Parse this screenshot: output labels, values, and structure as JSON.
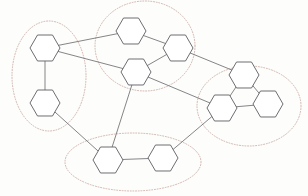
{
  "diagram": {
    "canvas": {
      "width": 308,
      "height": 196,
      "background": "#fdfdfc"
    },
    "style": {
      "node_fill": "#ffffff",
      "node_stroke": "#5d5d63",
      "edge_color": "#6f6f73",
      "cluster_stroke": "#c9a9a0",
      "cluster_dash": "dotted"
    },
    "clusters": [
      {
        "id": "cluster-left",
        "label": "",
        "cx": 49,
        "cy": 76,
        "rx": 37,
        "ry": 55,
        "rotate": 0,
        "members": [
          "n1",
          "n2"
        ]
      },
      {
        "id": "cluster-top-middle",
        "label": "",
        "cx": 145,
        "cy": 46,
        "rx": 50,
        "ry": 45,
        "rotate": 0,
        "members": [
          "n3",
          "n4",
          "n5"
        ]
      },
      {
        "id": "cluster-right",
        "label": "",
        "cx": 249,
        "cy": 106,
        "rx": 52,
        "ry": 40,
        "rotate": 0,
        "members": [
          "n6",
          "n7",
          "n8"
        ]
      },
      {
        "id": "cluster-bottom",
        "label": "",
        "cx": 133,
        "cy": 162,
        "rx": 68,
        "ry": 29,
        "rotate": 0,
        "members": [
          "n9",
          "n10"
        ]
      }
    ],
    "nodes": [
      {
        "id": "n1",
        "label": "",
        "x": 45,
        "y": 48,
        "r": 15,
        "cluster": "cluster-left"
      },
      {
        "id": "n2",
        "label": "",
        "x": 45,
        "y": 103,
        "r": 15,
        "cluster": "cluster-left"
      },
      {
        "id": "n3",
        "label": "",
        "x": 131,
        "y": 31,
        "r": 15,
        "cluster": "cluster-top-middle"
      },
      {
        "id": "n4",
        "label": "",
        "x": 178,
        "y": 48,
        "r": 15,
        "cluster": "cluster-top-middle"
      },
      {
        "id": "n5",
        "label": "",
        "x": 136,
        "y": 72,
        "r": 15,
        "cluster": "cluster-top-middle"
      },
      {
        "id": "n6",
        "label": "",
        "x": 244,
        "y": 75,
        "r": 15,
        "cluster": "cluster-right"
      },
      {
        "id": "n7",
        "label": "",
        "x": 222,
        "y": 108,
        "r": 15,
        "cluster": "cluster-right"
      },
      {
        "id": "n8",
        "label": "",
        "x": 268,
        "y": 104,
        "r": 15,
        "cluster": "cluster-right"
      },
      {
        "id": "n9",
        "label": "",
        "x": 108,
        "y": 160,
        "r": 15,
        "cluster": "cluster-bottom"
      },
      {
        "id": "n10",
        "label": "",
        "x": 163,
        "y": 158,
        "r": 15,
        "cluster": "cluster-bottom"
      }
    ],
    "edges": [
      {
        "source": "n1",
        "target": "n2",
        "type": "intra"
      },
      {
        "source": "n1",
        "target": "n3",
        "type": "inter"
      },
      {
        "source": "n1",
        "target": "n5",
        "type": "inter"
      },
      {
        "source": "n3",
        "target": "n4",
        "type": "intra"
      },
      {
        "source": "n4",
        "target": "n5",
        "type": "intra"
      },
      {
        "source": "n4",
        "target": "n6",
        "type": "inter"
      },
      {
        "source": "n5",
        "target": "n7",
        "type": "inter"
      },
      {
        "source": "n5",
        "target": "n9",
        "type": "inter"
      },
      {
        "source": "n2",
        "target": "n9",
        "type": "inter"
      },
      {
        "source": "n6",
        "target": "n7",
        "type": "intra"
      },
      {
        "source": "n6",
        "target": "n8",
        "type": "intra"
      },
      {
        "source": "n7",
        "target": "n8",
        "type": "intra"
      },
      {
        "source": "n7",
        "target": "n10",
        "type": "inter"
      },
      {
        "source": "n9",
        "target": "n10",
        "type": "intra"
      }
    ]
  }
}
